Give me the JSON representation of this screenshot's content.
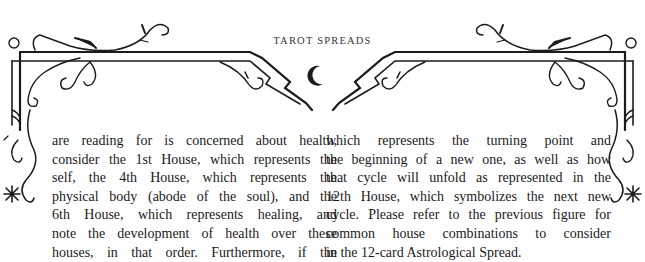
{
  "header": {
    "running_title": "TAROT SPREADS"
  },
  "ornament": {
    "center_icon": "crescent-moon-icon",
    "side_icons": [
      "star-icon",
      "star-icon"
    ],
    "color": "#1c1a1a"
  },
  "body": {
    "left_column": [
      "are reading for is concerned about health,",
      "consider the 1st House, which represents the",
      "self, the 4th House, which represents the",
      "physical body (abode of the soul), and the",
      "6th House, which represents healing, and",
      "note the development of health over these",
      "houses, in that order. Furthermore, if the"
    ],
    "right_column": [
      "which represents the turning point and",
      "the beginning of a new one, as well as how",
      "that cycle will unfold as represented in the",
      "12th House, which symbolizes the next new",
      "cycle. Please refer to the previous figure for",
      "common house combinations to consider",
      "in the 12-card Astrological Spread."
    ]
  }
}
